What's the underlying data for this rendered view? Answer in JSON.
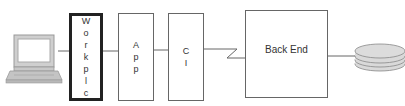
{
  "diagram": {
    "nodes": [
      {
        "id": "client",
        "label": "",
        "icon": "laptop-icon"
      },
      {
        "id": "workplc",
        "label": "Workplc",
        "orientation": "vertical",
        "emphasis": "thick-border"
      },
      {
        "id": "app",
        "label": "App",
        "orientation": "vertical"
      },
      {
        "id": "ci",
        "label": "CI",
        "orientation": "vertical"
      },
      {
        "id": "backend",
        "label": "Back End",
        "orientation": "horizontal"
      },
      {
        "id": "storage",
        "label": "",
        "icon": "database-disk-stack-icon"
      }
    ],
    "edges": [
      {
        "from": "client",
        "to": "workplc",
        "style": "line"
      },
      {
        "from": "workplc",
        "to": "app",
        "style": "line"
      },
      {
        "from": "app",
        "to": "ci",
        "style": "line"
      },
      {
        "from": "ci",
        "to": "backend",
        "style": "zigzag"
      },
      {
        "from": "backend",
        "to": "storage",
        "style": "line"
      }
    ],
    "colors": {
      "line": "#666666",
      "thick_border": "#222222",
      "disk_fill": "#d9d9d9"
    }
  },
  "labels": {
    "workplc": [
      "W",
      "o",
      "r",
      "k",
      "p",
      "l",
      "c"
    ],
    "app": [
      "A",
      "p",
      "p"
    ],
    "ci": [
      "C",
      "I"
    ],
    "backend": "Back End"
  }
}
